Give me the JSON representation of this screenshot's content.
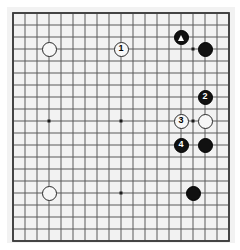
{
  "diagram": {
    "type": "go-board-diagram",
    "board_size": 19,
    "visible_columns": 19,
    "visible_rows": 20,
    "colors": {
      "board_background": "#f2f2f2",
      "page_background": "#ffffff",
      "grid_line": "#5a5a5a",
      "border_line": "#3a3a3a",
      "black_stone": "#111111",
      "white_stone": "#f7f7f7",
      "white_stone_outline": "#2a2a2a",
      "black_label_text": "#ffffff",
      "white_label_text": "#000000"
    },
    "geometry": {
      "origin_x": 13,
      "origin_y": 13,
      "cell_size": 12,
      "stone_diameter": 15,
      "star_point_size": 3
    },
    "star_points": [
      {
        "col": 3,
        "row": 3
      },
      {
        "col": 9,
        "row": 3
      },
      {
        "col": 15,
        "row": 3
      },
      {
        "col": 3,
        "row": 9
      },
      {
        "col": 9,
        "row": 9
      },
      {
        "col": 15,
        "row": 9
      },
      {
        "col": 3,
        "row": 15
      },
      {
        "col": 9,
        "row": 15
      },
      {
        "col": 15,
        "row": 15
      }
    ],
    "stones": [
      {
        "id": "white-upper-left-star",
        "color": "white",
        "col": 3,
        "row": 3,
        "label": "",
        "marker": ""
      },
      {
        "id": "move-1-white",
        "color": "white",
        "col": 9,
        "row": 3,
        "label": "1",
        "marker": ""
      },
      {
        "id": "black-marked-triangle",
        "color": "black",
        "col": 14,
        "row": 2,
        "label": "",
        "marker": "triangle"
      },
      {
        "id": "black-upper-right-star",
        "color": "black",
        "col": 16,
        "row": 3,
        "label": "",
        "marker": ""
      },
      {
        "id": "move-2-black",
        "color": "black",
        "col": 16,
        "row": 7,
        "label": "2",
        "marker": ""
      },
      {
        "id": "move-3-white",
        "color": "white",
        "col": 14,
        "row": 9,
        "label": "3",
        "marker": ""
      },
      {
        "id": "white-right-side",
        "color": "white",
        "col": 16,
        "row": 9,
        "label": "",
        "marker": ""
      },
      {
        "id": "move-4-black",
        "color": "black",
        "col": 14,
        "row": 11,
        "label": "4",
        "marker": ""
      },
      {
        "id": "black-right-side",
        "color": "black",
        "col": 16,
        "row": 11,
        "label": "",
        "marker": ""
      },
      {
        "id": "white-lower-left-star",
        "color": "white",
        "col": 3,
        "row": 15,
        "label": "",
        "marker": ""
      },
      {
        "id": "black-lower-right-star",
        "color": "black",
        "col": 15,
        "row": 15,
        "label": "",
        "marker": ""
      }
    ],
    "move_sequence": [
      {
        "number": "1",
        "color": "white"
      },
      {
        "number": "2",
        "color": "black"
      },
      {
        "number": "3",
        "color": "white"
      },
      {
        "number": "4",
        "color": "black"
      }
    ]
  }
}
